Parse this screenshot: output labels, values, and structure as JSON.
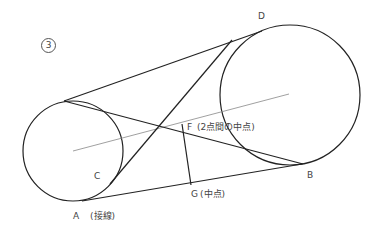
{
  "figure": {
    "number_badge": "3",
    "labels": {
      "A": "A",
      "A_note": "(接線)",
      "B": "B",
      "C": "C",
      "D": "D",
      "F": "F",
      "F_note": "(2点間の中点)",
      "G": "G",
      "G_note": "(中点)"
    },
    "colors": {
      "stroke": "#222222",
      "center_line": "#888888",
      "text": "#444444"
    },
    "geometry": {
      "small_circle": {
        "cx": 73,
        "cy": 151,
        "r": 50
      },
      "large_circle": {
        "cx": 290,
        "cy": 95,
        "r": 70
      },
      "center_line": {
        "x1": 73,
        "y1": 151,
        "x2": 289,
        "y2": 94
      },
      "outer_tangent_top": {
        "x1": 64,
        "y1": 101,
        "x2": 262,
        "y2": 31
      },
      "outer_tangent_bottom": {
        "x1": 82,
        "y1": 201,
        "x2": 302,
        "y2": 164
      },
      "cross_tangent_1": {
        "x1": 64,
        "y1": 101,
        "x2": 303,
        "y2": 164
      },
      "cross_tangent_2": {
        "x1": 110,
        "y1": 184,
        "x2": 232,
        "y2": 40
      },
      "fg_segment": {
        "x1": 182,
        "y1": 124,
        "x2": 191,
        "y2": 185
      }
    }
  }
}
